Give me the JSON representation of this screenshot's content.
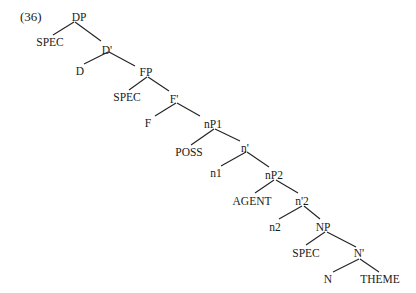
{
  "example_number": "(36)",
  "tree": {
    "nodes": [
      {
        "id": "DP",
        "label": "DP",
        "x": 79,
        "y": 11
      },
      {
        "id": "SPEC1",
        "label": "SPEC",
        "x": 50,
        "y": 36
      },
      {
        "id": "Dbar",
        "label": "D'",
        "x": 107,
        "y": 44
      },
      {
        "id": "D",
        "label": "D",
        "x": 80,
        "y": 65
      },
      {
        "id": "FP",
        "label": "FP",
        "x": 146,
        "y": 66
      },
      {
        "id": "SPEC2",
        "label": "SPEC",
        "x": 127,
        "y": 91
      },
      {
        "id": "Fbar",
        "label": "F'",
        "x": 174,
        "y": 93
      },
      {
        "id": "F",
        "label": "F",
        "x": 148,
        "y": 117
      },
      {
        "id": "nP1",
        "label": "nP1",
        "x": 213,
        "y": 118
      },
      {
        "id": "POSS",
        "label": "POSS",
        "x": 189,
        "y": 146
      },
      {
        "id": "nbar",
        "label": "n'",
        "x": 245,
        "y": 142
      },
      {
        "id": "n1",
        "label": "n1",
        "x": 216,
        "y": 167
      },
      {
        "id": "nP2",
        "label": "nP2",
        "x": 274,
        "y": 169
      },
      {
        "id": "AGENT",
        "label": "AGENT",
        "x": 252,
        "y": 195
      },
      {
        "id": "nbar2",
        "label": "n'2",
        "x": 302,
        "y": 195
      },
      {
        "id": "n2",
        "label": "n2",
        "x": 275,
        "y": 221
      },
      {
        "id": "NP",
        "label": "NP",
        "x": 323,
        "y": 221
      },
      {
        "id": "SPEC3",
        "label": "SPEC",
        "x": 306,
        "y": 247
      },
      {
        "id": "Nbar",
        "label": "N'",
        "x": 359,
        "y": 247
      },
      {
        "id": "N",
        "label": "N",
        "x": 328,
        "y": 273
      },
      {
        "id": "THEME",
        "label": "THEME",
        "x": 380,
        "y": 273
      }
    ],
    "edges": [
      {
        "from": "DP",
        "to": "SPEC1",
        "x1": 74,
        "y1": 22,
        "x2": 53,
        "y2": 35
      },
      {
        "from": "DP",
        "to": "Dbar",
        "x1": 75,
        "y1": 22,
        "x2": 101,
        "y2": 41
      },
      {
        "from": "Dbar",
        "to": "D",
        "x1": 108,
        "y1": 52,
        "x2": 84,
        "y2": 64
      },
      {
        "from": "Dbar",
        "to": "FP",
        "x1": 109,
        "y1": 52,
        "x2": 135,
        "y2": 66
      },
      {
        "from": "FP",
        "to": "SPEC2",
        "x1": 147,
        "y1": 77,
        "x2": 129,
        "y2": 90
      },
      {
        "from": "FP",
        "to": "Fbar",
        "x1": 148,
        "y1": 77,
        "x2": 169,
        "y2": 91
      },
      {
        "from": "Fbar",
        "to": "F",
        "x1": 176,
        "y1": 103,
        "x2": 155,
        "y2": 116
      },
      {
        "from": "Fbar",
        "to": "nP1",
        "x1": 177,
        "y1": 103,
        "x2": 200,
        "y2": 116
      },
      {
        "from": "nP1",
        "to": "POSS",
        "x1": 214,
        "y1": 129,
        "x2": 191,
        "y2": 145
      },
      {
        "from": "nP1",
        "to": "nbar",
        "x1": 215,
        "y1": 129,
        "x2": 240,
        "y2": 141
      },
      {
        "from": "nbar",
        "to": "n1",
        "x1": 246,
        "y1": 152,
        "x2": 221,
        "y2": 166
      },
      {
        "from": "nbar",
        "to": "nP2",
        "x1": 247,
        "y1": 152,
        "x2": 269,
        "y2": 167
      },
      {
        "from": "nP2",
        "to": "AGENT",
        "x1": 274,
        "y1": 180,
        "x2": 255,
        "y2": 193
      },
      {
        "from": "nP2",
        "to": "nbar2",
        "x1": 276,
        "y1": 180,
        "x2": 298,
        "y2": 193
      },
      {
        "from": "nbar2",
        "to": "n2",
        "x1": 302,
        "y1": 206,
        "x2": 279,
        "y2": 219
      },
      {
        "from": "nbar2",
        "to": "NP",
        "x1": 304,
        "y1": 206,
        "x2": 320,
        "y2": 219
      },
      {
        "from": "NP",
        "to": "SPEC3",
        "x1": 325,
        "y1": 232,
        "x2": 306,
        "y2": 245
      },
      {
        "from": "NP",
        "to": "Nbar",
        "x1": 327,
        "y1": 232,
        "x2": 356,
        "y2": 247
      },
      {
        "from": "Nbar",
        "to": "N",
        "x1": 359,
        "y1": 259,
        "x2": 333,
        "y2": 272
      },
      {
        "from": "Nbar",
        "to": "THEME",
        "x1": 360,
        "y1": 259,
        "x2": 379,
        "y2": 272
      }
    ]
  }
}
